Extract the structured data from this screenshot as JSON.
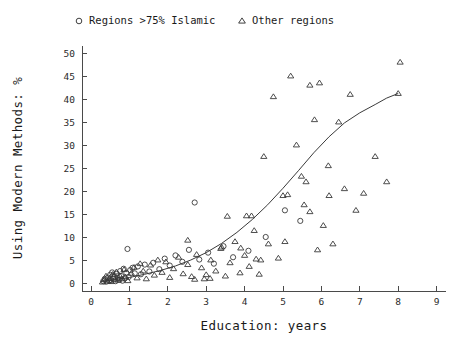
{
  "chart_data": {
    "type": "scatter",
    "title": "",
    "xlabel": "Education: years",
    "ylabel": "Using Modern Methods: %",
    "xlim": [
      -0.18,
      9.45
    ],
    "ylim": [
      -2.2,
      52.5
    ],
    "xticks": [
      0,
      1,
      2,
      3,
      4,
      5,
      6,
      7,
      8,
      9
    ],
    "xticklabels": [
      "0",
      "1",
      "2",
      "3",
      "4",
      "5",
      "6",
      "7",
      "8",
      "9"
    ],
    "yticks": [
      0,
      5,
      10,
      15,
      20,
      25,
      30,
      35,
      40,
      45,
      50
    ],
    "yticklabels": [
      "0",
      "5",
      "10",
      "15",
      "20",
      "25",
      "30",
      "35",
      "40",
      "45",
      "50"
    ],
    "grid": false,
    "legend_position": "top",
    "series": [
      {
        "name": "Regions >75% Islamic",
        "marker": "circle",
        "marker_symbol": "o",
        "color": "#3a3a3a",
        "points": [
          [
            0.32,
            0.4
          ],
          [
            0.36,
            0.9
          ],
          [
            0.4,
            0.3
          ],
          [
            0.44,
            1.2
          ],
          [
            0.47,
            0.5
          ],
          [
            0.5,
            1.8
          ],
          [
            0.52,
            0.6
          ],
          [
            0.55,
            2.3
          ],
          [
            0.58,
            0.9
          ],
          [
            0.61,
            1.4
          ],
          [
            0.64,
            0.4
          ],
          [
            0.67,
            2.0
          ],
          [
            0.7,
            1.1
          ],
          [
            0.73,
            0.7
          ],
          [
            0.76,
            2.6
          ],
          [
            0.79,
            1.5
          ],
          [
            0.82,
            0.5
          ],
          [
            0.85,
            3.1
          ],
          [
            0.88,
            1.0
          ],
          [
            0.92,
            2.2
          ],
          [
            0.95,
            7.4
          ],
          [
            0.98,
            1.3
          ],
          [
            1.02,
            2.8
          ],
          [
            1.08,
            3.3
          ],
          [
            1.14,
            2.1
          ],
          [
            1.22,
            3.6
          ],
          [
            1.3,
            1.9
          ],
          [
            1.4,
            4.0
          ],
          [
            1.52,
            2.5
          ],
          [
            1.62,
            4.4
          ],
          [
            1.78,
            3.0
          ],
          [
            1.92,
            5.3
          ],
          [
            2.05,
            3.8
          ],
          [
            2.2,
            6.0
          ],
          [
            2.38,
            4.6
          ],
          [
            2.55,
            7.2
          ],
          [
            2.7,
            17.5
          ],
          [
            2.82,
            5.1
          ],
          [
            3.05,
            6.6
          ],
          [
            3.2,
            4.2
          ],
          [
            3.45,
            8.0
          ],
          [
            3.7,
            5.6
          ],
          [
            4.1,
            7.0
          ],
          [
            4.55,
            10.0
          ],
          [
            5.05,
            15.8
          ],
          [
            5.45,
            13.5
          ]
        ]
      },
      {
        "name": "Other regions",
        "marker": "triangle",
        "marker_symbol": "△",
        "color": "#3a3a3a",
        "points": [
          [
            0.3,
            0.2
          ],
          [
            0.35,
            0.7
          ],
          [
            0.39,
            1.5
          ],
          [
            0.43,
            0.4
          ],
          [
            0.48,
            1.0
          ],
          [
            0.53,
            0.3
          ],
          [
            0.57,
            1.9
          ],
          [
            0.62,
            0.8
          ],
          [
            0.66,
            2.4
          ],
          [
            0.71,
            0.6
          ],
          [
            0.75,
            1.6
          ],
          [
            0.8,
            0.9
          ],
          [
            0.86,
            2.9
          ],
          [
            0.9,
            1.3
          ],
          [
            0.96,
            0.5
          ],
          [
            1.05,
            2.1
          ],
          [
            1.12,
            3.4
          ],
          [
            1.2,
            1.1
          ],
          [
            1.28,
            4.2
          ],
          [
            1.36,
            2.6
          ],
          [
            1.44,
            0.9
          ],
          [
            1.55,
            3.9
          ],
          [
            1.65,
            1.7
          ],
          [
            1.74,
            5.0
          ],
          [
            1.85,
            2.3
          ],
          [
            1.95,
            4.6
          ],
          [
            2.05,
            1.2
          ],
          [
            2.15,
            3.1
          ],
          [
            2.28,
            5.6
          ],
          [
            2.4,
            2.0
          ],
          [
            2.52,
            4.0
          ],
          [
            2.62,
            1.4
          ],
          [
            2.75,
            6.2
          ],
          [
            2.88,
            3.3
          ],
          [
            3.0,
            1.8
          ],
          [
            3.12,
            5.0
          ],
          [
            3.25,
            2.6
          ],
          [
            3.38,
            7.5
          ],
          [
            3.5,
            1.5
          ],
          [
            3.62,
            4.4
          ],
          [
            3.75,
            9.0
          ],
          [
            3.88,
            2.2
          ],
          [
            4.0,
            6.0
          ],
          [
            4.12,
            3.6
          ],
          [
            4.25,
            11.4
          ],
          [
            4.38,
            1.9
          ],
          [
            4.5,
            27.5
          ],
          [
            4.62,
            8.5
          ],
          [
            4.75,
            40.5
          ],
          [
            4.88,
            5.4
          ],
          [
            5.0,
            19.0
          ],
          [
            5.12,
            19.2
          ],
          [
            5.2,
            45.0
          ],
          [
            5.35,
            30.0
          ],
          [
            5.48,
            23.2
          ],
          [
            5.6,
            22.0
          ],
          [
            5.7,
            43.0
          ],
          [
            5.82,
            35.5
          ],
          [
            5.95,
            43.5
          ],
          [
            6.05,
            12.5
          ],
          [
            6.18,
            25.5
          ],
          [
            6.3,
            8.5
          ],
          [
            6.45,
            35.0
          ],
          [
            6.6,
            20.5
          ],
          [
            6.75,
            41.0
          ],
          [
            6.9,
            15.8
          ],
          [
            7.1,
            19.5
          ],
          [
            7.4,
            27.5
          ],
          [
            7.7,
            22.0
          ],
          [
            8.05,
            48.0
          ],
          [
            8.0,
            41.2
          ],
          [
            3.55,
            14.5
          ],
          [
            4.05,
            14.6
          ],
          [
            4.18,
            14.6
          ],
          [
            2.52,
            9.3
          ],
          [
            2.7,
            0.8
          ],
          [
            2.95,
            0.9
          ],
          [
            3.1,
            1.0
          ],
          [
            3.4,
            7.8
          ],
          [
            3.9,
            7.6
          ],
          [
            4.3,
            5.2
          ],
          [
            4.42,
            5.0
          ],
          [
            5.05,
            9.0
          ],
          [
            5.9,
            7.2
          ],
          [
            6.2,
            19.0
          ],
          [
            5.55,
            17.0
          ],
          [
            5.7,
            15.5
          ]
        ]
      }
    ],
    "fit_curve": {
      "name": "fitted trend",
      "type": "exponential",
      "points": [
        [
          0.25,
          0.35
        ],
        [
          0.6,
          0.7
        ],
        [
          1.0,
          1.2
        ],
        [
          1.4,
          1.9
        ],
        [
          1.8,
          2.7
        ],
        [
          2.2,
          3.7
        ],
        [
          2.6,
          5.0
        ],
        [
          3.0,
          6.6
        ],
        [
          3.4,
          8.6
        ],
        [
          3.8,
          11.0
        ],
        [
          4.2,
          13.8
        ],
        [
          4.6,
          17.0
        ],
        [
          5.0,
          20.6
        ],
        [
          5.4,
          24.4
        ],
        [
          5.8,
          28.3
        ],
        [
          6.2,
          31.8
        ],
        [
          6.6,
          34.8
        ],
        [
          7.0,
          37.0
        ],
        [
          7.4,
          38.8
        ],
        [
          7.7,
          40.2
        ],
        [
          8.0,
          41.2
        ]
      ]
    }
  },
  "legend": {
    "entries": [
      {
        "label": "Regions >75% Islamic",
        "marker": "o"
      },
      {
        "label": "Other regions",
        "marker": "△"
      }
    ]
  }
}
